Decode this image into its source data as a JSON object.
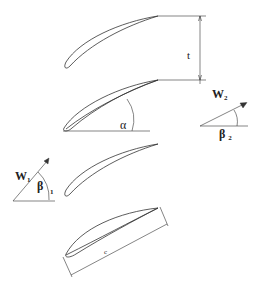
{
  "diagram": {
    "type": "cascade-blade-geometry",
    "labels": {
      "pitch": "t",
      "stagger_angle": "α",
      "outlet_velocity": "W",
      "outlet_velocity_sub": "2",
      "outlet_angle": "β",
      "outlet_angle_sub": "2",
      "inlet_velocity": "W",
      "inlet_velocity_sub": "1",
      "inlet_angle": "β",
      "inlet_angle_sub": "1",
      "chord": "c"
    },
    "blades": 4,
    "colors": {
      "stroke": "#333333",
      "background": "#ffffff"
    }
  }
}
